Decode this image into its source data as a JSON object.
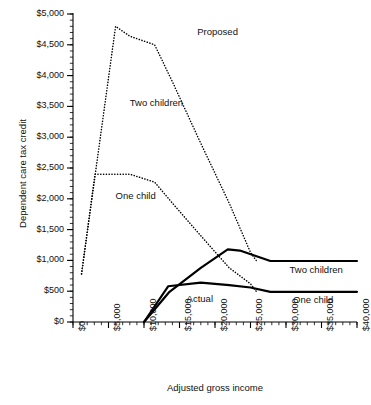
{
  "chart_data": {
    "type": "line",
    "title": "",
    "xlabel": "Adjusted gross income",
    "ylabel": "Dependent care tax credit",
    "xlim": [
      0,
      40000
    ],
    "ylim": [
      0,
      5000
    ],
    "grid": false,
    "legend_position": "inline-annotations",
    "x_ticks": [
      "$0",
      "$5,000",
      "$10,000",
      "$15,000",
      "$20,000",
      "$25,000",
      "$30,000",
      "$35,000",
      "$40,000"
    ],
    "x_tick_values": [
      0,
      5000,
      10000,
      15000,
      20000,
      25000,
      30000,
      35000,
      40000
    ],
    "x_minor_tick_step": 1000,
    "y_ticks": [
      "$0",
      "$500",
      "$1,000",
      "$1,500",
      "$2,000",
      "$2,500",
      "$3,000",
      "$3,500",
      "$4,000",
      "$4,500",
      "$5,000"
    ],
    "y_tick_values": [
      0,
      500,
      1000,
      1500,
      2000,
      2500,
      3000,
      3500,
      4000,
      4500,
      5000
    ],
    "y_minor_tick_step": 100,
    "annotations": [
      {
        "name": "proposed",
        "text": "Proposed",
        "x": 17500,
        "y": 4700
      },
      {
        "name": "proposed-two-children",
        "text": "Two children",
        "x": 8000,
        "y": 3550
      },
      {
        "name": "proposed-one-child",
        "text": "One child",
        "x": 6000,
        "y": 2050
      },
      {
        "name": "actual",
        "text": "Actual",
        "x": 16000,
        "y": 380
      },
      {
        "name": "actual-two-children",
        "text": "Two children",
        "x": 30500,
        "y": 840
      },
      {
        "name": "actual-one-child",
        "text": "One child",
        "x": 31000,
        "y": 350
      }
    ],
    "series": [
      {
        "name": "Proposed - Two children",
        "style": "dotted",
        "color": "#000000",
        "points": [
          [
            1200,
            780
          ],
          [
            6000,
            4800
          ],
          [
            8000,
            4640
          ],
          [
            11500,
            4500
          ],
          [
            14000,
            3900
          ],
          [
            18000,
            2900
          ],
          [
            22000,
            1930
          ],
          [
            25000,
            1130
          ],
          [
            25800,
            1000
          ]
        ]
      },
      {
        "name": "Proposed - One child",
        "style": "dotted",
        "color": "#000000",
        "points": [
          [
            1200,
            780
          ],
          [
            3100,
            2400
          ],
          [
            8000,
            2400
          ],
          [
            11500,
            2270
          ],
          [
            14000,
            1930
          ],
          [
            18000,
            1400
          ],
          [
            22000,
            880
          ],
          [
            25000,
            620
          ],
          [
            25800,
            500
          ]
        ]
      },
      {
        "name": "Actual - Two children",
        "style": "solid",
        "color": "#000000",
        "points": [
          [
            10000,
            0
          ],
          [
            13500,
            480
          ],
          [
            18000,
            880
          ],
          [
            21800,
            1180
          ],
          [
            23500,
            1160
          ],
          [
            27800,
            990
          ],
          [
            40000,
            990
          ]
        ]
      },
      {
        "name": "Actual - One child",
        "style": "solid",
        "color": "#000000",
        "points": [
          [
            10000,
            0
          ],
          [
            13400,
            580
          ],
          [
            18000,
            640
          ],
          [
            22000,
            600
          ],
          [
            25000,
            560
          ],
          [
            27800,
            490
          ],
          [
            40000,
            490
          ]
        ]
      }
    ]
  }
}
